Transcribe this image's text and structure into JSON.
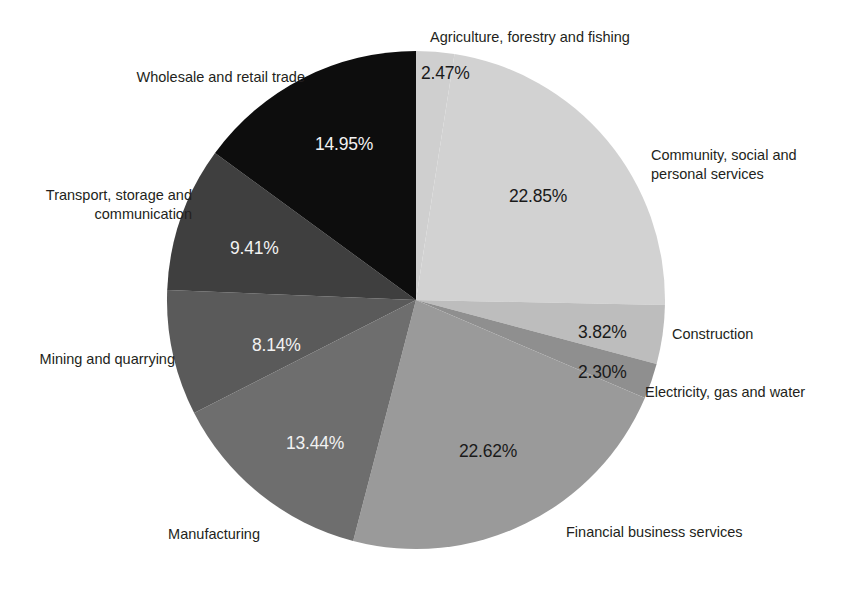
{
  "chart_data": {
    "type": "pie",
    "title": "",
    "subtitle": "",
    "legend_position": "outside-labels",
    "grid": false,
    "start_angle_deg": 0,
    "direction": "clockwise",
    "categories": [
      "Agriculture, forestry and fishing",
      "Community, social and personal services",
      "Construction",
      "Electricity, gas and water",
      "Financial business services",
      "Manufacturing",
      "Mining and quarrying",
      "Transport, storage and communication",
      "Wholesale and retail trade"
    ],
    "values": [
      2.47,
      22.85,
      3.82,
      2.3,
      22.62,
      13.44,
      8.14,
      9.41,
      14.95
    ],
    "value_labels": [
      "2.47%",
      "22.85%",
      "3.82%",
      "2.30%",
      "22.62%",
      "13.44%",
      "8.14%",
      "9.41%",
      "14.95%"
    ],
    "colors": [
      "#cfcfcf",
      "#d2d2d2",
      "#bdbdbd",
      "#8f8f8f",
      "#9a9a9a",
      "#6e6e6e",
      "#5a5a5a",
      "#3f3f3f",
      "#0d0d0d"
    ],
    "xlabel": "",
    "ylabel": ""
  },
  "slices": [
    {
      "name": "agriculture",
      "label": "Agriculture, forestry and fishing",
      "value_label": "2.47%",
      "label_lines": [
        "Agriculture, forestry and fishing"
      ]
    },
    {
      "name": "community-social-personal-services",
      "label": "Community, social and personal services",
      "value_label": "22.85%",
      "label_lines": [
        "Community, social and",
        "personal services"
      ]
    },
    {
      "name": "construction",
      "label": "Construction",
      "value_label": "3.82%",
      "label_lines": [
        "Construction"
      ]
    },
    {
      "name": "electricity-gas-water",
      "label": "Electricity, gas and water",
      "value_label": "2.30%",
      "label_lines": [
        "Electricity, gas and water"
      ]
    },
    {
      "name": "financial-business-services",
      "label": "Financial business services",
      "value_label": "22.62%",
      "label_lines": [
        "Financial business services"
      ]
    },
    {
      "name": "manufacturing",
      "label": "Manufacturing",
      "value_label": "13.44%",
      "label_lines": [
        "Manufacturing"
      ]
    },
    {
      "name": "mining-and-quarrying",
      "label": "Mining and quarrying",
      "value_label": "8.14%",
      "label_lines": [
        "Mining and quarrying"
      ]
    },
    {
      "name": "transport-storage-communication",
      "label": "Transport, storage and communication",
      "value_label": "9.41%",
      "label_lines": [
        "Transport, storage and",
        "communication"
      ]
    },
    {
      "name": "wholesale-and-retail-trade",
      "label": "Wholesale and retail trade",
      "value_label": "14.95%",
      "label_lines": [
        "Wholesale and retail trade"
      ]
    }
  ],
  "labels": {
    "agriculture_line1": "Agriculture, forestry and fishing",
    "community_line1": "Community, social and",
    "community_line2": "personal services",
    "construction_line1": "Construction",
    "electricity_line1": "Electricity, gas and water",
    "financial_line1": "Financial business services",
    "manufacturing_line1": "Manufacturing",
    "mining_line1": "Mining and quarrying",
    "transport_line1": "Transport, storage and",
    "transport_line2": "communication",
    "wholesale_line1": "Wholesale and retail trade"
  },
  "values": {
    "agriculture": "2.47%",
    "community": "22.85%",
    "construction": "3.82%",
    "electricity": "2.30%",
    "financial": "22.62%",
    "manufacturing": "13.44%",
    "mining": "8.14%",
    "transport": "9.41%",
    "wholesale": "14.95%"
  }
}
